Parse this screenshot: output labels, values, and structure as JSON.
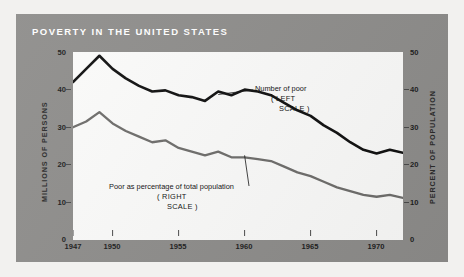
{
  "title": "POVERTY IN THE UNITED STATES",
  "colors": {
    "panel": "#8e8d8b",
    "plot_background": "#fbfbfa",
    "series_poor": "#101010",
    "series_percent": "#6e6d6b",
    "title_text": "#ffffff"
  },
  "axes": {
    "left_label": "MILLIONS OF PERSONS",
    "right_label": "PERCENT OF POPULATION",
    "left_ticks": [
      "50",
      "40",
      "30",
      "20",
      "10",
      "0"
    ],
    "right_ticks": [
      "50",
      "40",
      "30",
      "20",
      "10",
      "0"
    ],
    "x_ticks": [
      "1947",
      "1950",
      "1955",
      "1960",
      "1965",
      "1970"
    ]
  },
  "annotations": {
    "poor": {
      "line1": "Number of poor",
      "line2": "( LEFT",
      "line3": "SCALE )"
    },
    "percent": {
      "line1": "Poor as percentage of total population",
      "line2": "( RIGHT",
      "line3": "SCALE )"
    }
  },
  "chart_data": {
    "type": "line",
    "title": "POVERTY IN THE UNITED STATES",
    "xlabel": "",
    "ylabel": "MILLIONS OF PERSONS",
    "ylabel_secondary": "PERCENT OF POPULATION",
    "xlim": [
      1947,
      1972
    ],
    "ylim": [
      0,
      50
    ],
    "ylim_secondary": [
      0,
      50
    ],
    "grid": false,
    "legend": "inline-annotations",
    "x": [
      1947,
      1948,
      1949,
      1950,
      1951,
      1952,
      1953,
      1954,
      1955,
      1956,
      1957,
      1958,
      1959,
      1960,
      1961,
      1962,
      1963,
      1964,
      1965,
      1966,
      1967,
      1968,
      1969,
      1970,
      1971,
      1972
    ],
    "series": [
      {
        "name": "Number of poor",
        "scale": "left",
        "units": "millions of persons",
        "color": "#101010",
        "values": [
          42.0,
          45.5,
          49.0,
          45.5,
          43.0,
          41.0,
          39.5,
          39.8,
          38.5,
          38.0,
          37.0,
          39.5,
          38.5,
          40.0,
          39.5,
          38.5,
          36.5,
          34.5,
          33.0,
          30.5,
          28.5,
          26.0,
          24.0,
          23.0,
          24.0,
          23.2
        ]
      },
      {
        "name": "Poor as percentage of total population",
        "scale": "right",
        "units": "percent of population",
        "color": "#6e6d6b",
        "values": [
          30.0,
          31.5,
          34.0,
          31.0,
          29.0,
          27.5,
          26.0,
          26.5,
          24.5,
          23.5,
          22.5,
          23.5,
          22.0,
          22.0,
          21.5,
          21.0,
          19.5,
          18.0,
          17.0,
          15.5,
          14.0,
          13.0,
          12.0,
          11.5,
          12.0,
          11.2
        ]
      }
    ]
  }
}
